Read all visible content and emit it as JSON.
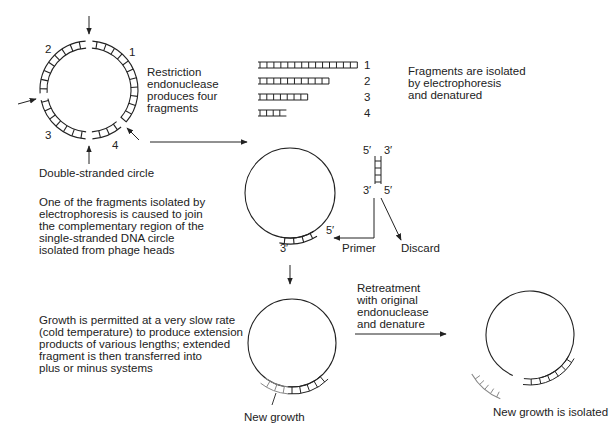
{
  "diagram": {
    "steps": {
      "restriction": "Restriction\nendonuclease\nproduces four\nfragments",
      "double_stranded_label": "Double-stranded circle",
      "electrophoresis": "Fragments are isolated\nby electrophoresis\nand denatured",
      "join": "One of the fragments isolated by\nelectrophoresis is caused to join\nthe complementary region of the\nsingle-stranded DNA circle\nisolated from phage heads",
      "growth": "Growth is permitted at a very slow rate\n(cold temperature) to produce extension\nproducts of various lengths; extended\nfragment is then transferred into\nplus or minus systems",
      "retreatment": "Retreatment\nwith original\nendonuclease\nand denature"
    },
    "circle_fragment_labels": [
      "1",
      "2",
      "3",
      "4"
    ],
    "fragments": [
      {
        "label": "1",
        "rungs": 14
      },
      {
        "label": "2",
        "rungs": 10
      },
      {
        "label": "3",
        "rungs": 7
      },
      {
        "label": "4",
        "rungs": 4
      }
    ],
    "strand_ends": {
      "top_left": "5′",
      "top_right": "3′",
      "bottom_left": "3′",
      "bottom_right": "5′",
      "primer_5": "5′",
      "primer_3": "3′"
    },
    "primer_label": "Primer",
    "discard_label": "Discard",
    "new_growth_label": "New growth",
    "new_growth_isolated_label": "New growth is isolated",
    "colors": {
      "line": "#222222",
      "new_growth": "#888888",
      "background": "#ffffff"
    }
  }
}
